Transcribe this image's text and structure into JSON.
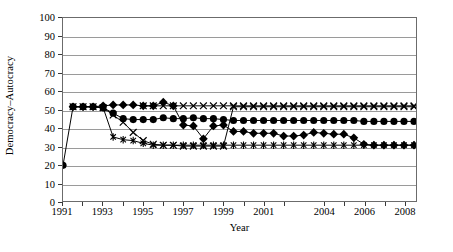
{
  "chart_data": {
    "type": "line",
    "title": "",
    "xlabel": "Year",
    "ylabel": "Democracy–Autocracy",
    "xlim": [
      1991,
      2008.6
    ],
    "ylim": [
      0,
      100
    ],
    "grid": true,
    "legend": "none",
    "y_ticks": [
      0,
      10,
      20,
      30,
      40,
      50,
      60,
      70,
      80,
      90,
      100
    ],
    "x_ticks": [
      1991,
      1992,
      1993,
      1994,
      1995,
      1996,
      1997,
      1998,
      1999,
      2000,
      2001,
      2002,
      2004,
      2005,
      2006,
      2007,
      2008
    ],
    "x_tick_labels": [
      "1991",
      "",
      "1993",
      "",
      "1995",
      "",
      "1997",
      "",
      "1999",
      "",
      "2001",
      "",
      "2004",
      "",
      "2006",
      "",
      "2008"
    ],
    "x": [
      1991,
      1991.5,
      1992,
      1992.5,
      1993,
      1993.5,
      1994,
      1994.5,
      1995,
      1995.5,
      1996,
      1996.5,
      1997,
      1997.5,
      1998,
      1998.5,
      1999,
      1999.5,
      2000,
      2000.5,
      2001,
      2001.5,
      2002,
      2002.5,
      2003,
      2003.5,
      2004,
      2004.5,
      2005,
      2005.5,
      2006,
      2006.5,
      2007,
      2007.5,
      2008,
      2008.5
    ],
    "series": [
      {
        "name": "circle-series",
        "marker": "circle",
        "values": [
          19.5,
          51.5,
          51.5,
          51.5,
          51,
          48,
          45,
          44.5,
          44.5,
          44.5,
          45.5,
          45,
          45,
          45.5,
          45,
          45,
          44.5,
          44,
          44,
          44,
          44,
          44,
          44,
          44,
          44,
          44,
          44,
          44,
          44,
          44,
          43.5,
          43.5,
          43.5,
          43.5,
          43.5,
          43.5
        ]
      },
      {
        "name": "diamond-series",
        "marker": "diamond",
        "values": [
          null,
          51.5,
          51.5,
          51.5,
          52,
          52.5,
          52.5,
          52.5,
          52,
          52,
          54,
          52,
          41.5,
          41,
          34,
          41,
          41.5,
          38,
          38,
          37,
          37,
          37,
          35.5,
          35.5,
          36,
          37.5,
          37,
          36.5,
          36.5,
          34.5,
          31,
          30.5,
          30.5,
          30.5,
          30.5,
          30.5
        ]
      },
      {
        "name": "cross-series",
        "marker": "cross",
        "values": [
          null,
          51.5,
          51.5,
          51.5,
          51,
          47,
          43,
          37.5,
          33,
          31,
          30.5,
          30.5,
          30,
          30,
          30,
          30,
          30,
          51.5,
          51.5,
          51.5,
          51.5,
          51.5,
          51.5,
          51.5,
          51.5,
          51.5,
          51.5,
          51.5,
          51.5,
          51.5,
          51.5,
          51.5,
          51.5,
          51.5,
          51.5,
          51.5
        ]
      },
      {
        "name": "asterisk-series",
        "marker": "asterisk",
        "values": [
          null,
          51.5,
          51.5,
          51.5,
          51,
          35,
          33.5,
          33,
          31.5,
          30.5,
          30.5,
          30.5,
          30.5,
          30.5,
          30.5,
          30.5,
          30.5,
          30.5,
          30.5,
          30.5,
          30.5,
          30.5,
          30.5,
          30.5,
          30.5,
          30.5,
          30.5,
          30.5,
          30.5,
          30.5,
          30.5,
          30.5,
          30.5,
          30.5,
          30.5,
          30.5
        ]
      },
      {
        "name": "upper-cross-series",
        "marker": "cross",
        "values": [
          null,
          null,
          null,
          null,
          null,
          null,
          null,
          null,
          52,
          52,
          52,
          52,
          52,
          52,
          52,
          52,
          52,
          52,
          52,
          52,
          52,
          52,
          52,
          52,
          52,
          52,
          52,
          52,
          52,
          52,
          52,
          52,
          52,
          52,
          52,
          52
        ]
      }
    ]
  }
}
